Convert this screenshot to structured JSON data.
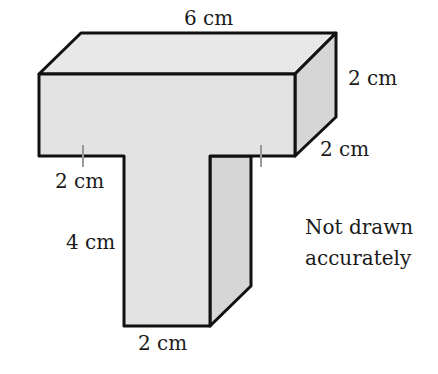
{
  "diagram": {
    "type": "3d-prism-T-shape",
    "labels": {
      "top_length": "6 cm",
      "right_height": "2 cm",
      "right_depth": "2 cm",
      "left_overhang": "2 cm",
      "stem_height": "4 cm",
      "stem_width": "2 cm"
    },
    "note_line1": "Not drawn",
    "note_line2": "accurately",
    "colors": {
      "front_face": "#e3e3e3",
      "top_face": "#e8e8e8",
      "side_face": "#d6d6d6",
      "outline": "#111111",
      "tick": "#9a9a9a"
    }
  }
}
